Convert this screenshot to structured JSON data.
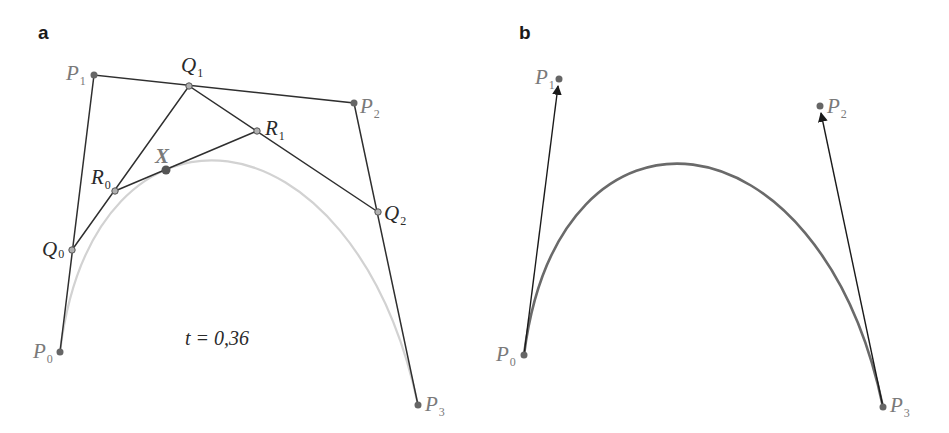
{
  "panels": {
    "a": {
      "label": "a",
      "parameter_text": "t = 0,36",
      "points": {
        "P0": {
          "name": "P",
          "sub": "0"
        },
        "P1": {
          "name": "P",
          "sub": "1"
        },
        "P2": {
          "name": "P",
          "sub": "2"
        },
        "P3": {
          "name": "P",
          "sub": "3"
        },
        "Q0": {
          "name": "Q",
          "sub": "0"
        },
        "Q1": {
          "name": "Q",
          "sub": "1"
        },
        "Q2": {
          "name": "Q",
          "sub": "2"
        },
        "R0": {
          "name": "R",
          "sub": "0"
        },
        "R1": {
          "name": "R",
          "sub": "1"
        },
        "X": {
          "name": "X"
        }
      }
    },
    "b": {
      "label": "b",
      "points": {
        "P0": {
          "name": "P",
          "sub": "0"
        },
        "P1": {
          "name": "P",
          "sub": "1"
        },
        "P2": {
          "name": "P",
          "sub": "2"
        },
        "P3": {
          "name": "P",
          "sub": "3"
        }
      }
    }
  },
  "colors": {
    "control_lines": "#2a2a2a",
    "curve_faint": "#cfcfcf",
    "curve_solid": "#6a6a6a",
    "control_points": "#666666",
    "construction_points": "#a8a8a8"
  }
}
